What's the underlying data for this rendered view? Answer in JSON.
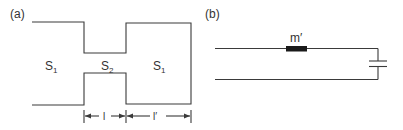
{
  "panel_a": {
    "label": "(a)",
    "regions": [
      {
        "symbol": "S",
        "subscript": "1"
      },
      {
        "symbol": "S",
        "subscript": "2"
      },
      {
        "symbol": "S",
        "subscript": "1"
      }
    ],
    "dimensions": [
      {
        "label": "l"
      },
      {
        "label": "l′"
      }
    ]
  },
  "panel_b": {
    "label": "(b)",
    "inductor_label": "m′",
    "components": [
      "inductor",
      "capacitor"
    ]
  },
  "colors": {
    "line": "#3a3a3a",
    "inductor_fill": "#1a1a1a",
    "text": "#333333"
  }
}
